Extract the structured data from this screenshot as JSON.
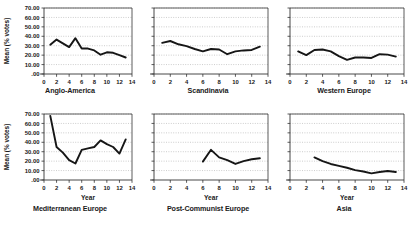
{
  "figure": {
    "background_color": "#ffffff",
    "line_color": "#161616",
    "grid_color": "#9a9a9a",
    "axis_color": "#333333",
    "text_color": "#1a1a1a"
  },
  "chart_data": [
    {
      "type": "line",
      "title": "Anglo-America",
      "xlabel": "",
      "ylabel": "Mean (% votes)",
      "xlim": [
        0,
        14
      ],
      "ylim": [
        0,
        70
      ],
      "xticks": [
        0,
        2,
        4,
        6,
        8,
        10,
        12,
        14
      ],
      "xticklabels": [
        "0",
        "2",
        "4",
        "6",
        "8",
        "10",
        "12",
        "14"
      ],
      "yticks": [
        0,
        10,
        20,
        30,
        40,
        50,
        60,
        70
      ],
      "yticklabels": [
        ".00",
        "10.00",
        "20.00",
        "30.00",
        "40.00",
        "50.00",
        "60.00",
        "70.00"
      ],
      "grid": true,
      "legend": "none",
      "x": [
        1,
        2,
        3,
        4,
        5,
        6,
        7,
        8,
        9,
        10,
        11,
        12,
        13
      ],
      "values": [
        31.0,
        36.5,
        32.5,
        28.5,
        38.0,
        27.0,
        27.0,
        25.0,
        20.5,
        23.0,
        22.5,
        20.0,
        17.5
      ]
    },
    {
      "type": "line",
      "title": "Scandinavia",
      "xlabel": "",
      "ylabel": "",
      "xlim": [
        0,
        14
      ],
      "ylim": [
        0,
        70
      ],
      "xticks": [
        0,
        2,
        4,
        6,
        8,
        10,
        12,
        14
      ],
      "xticklabels": [
        "0",
        "2",
        "4",
        "6",
        "8",
        "10",
        "12",
        "14"
      ],
      "yticks": [
        0,
        10,
        20,
        30,
        40,
        50,
        60,
        70
      ],
      "yticklabels": [
        ".00",
        "10.00",
        "20.00",
        "30.00",
        "40.00",
        "50.00",
        "60.00",
        "70.00"
      ],
      "grid": true,
      "legend": "none",
      "x": [
        1,
        2,
        3,
        4,
        5,
        6,
        7,
        8,
        9,
        10,
        11,
        12,
        13
      ],
      "values": [
        33.0,
        35.0,
        31.5,
        29.5,
        26.5,
        24.0,
        26.5,
        26.0,
        21.0,
        24.0,
        25.0,
        25.5,
        29.0
      ]
    },
    {
      "type": "line",
      "title": "Western Europe",
      "xlabel": "",
      "ylabel": "",
      "xlim": [
        0,
        14
      ],
      "ylim": [
        0,
        70
      ],
      "xticks": [
        0,
        2,
        4,
        6,
        8,
        10,
        12,
        14
      ],
      "xticklabels": [
        "0",
        "2",
        "4",
        "6",
        "8",
        "10",
        "12",
        "14"
      ],
      "yticks": [
        0,
        10,
        20,
        30,
        40,
        50,
        60,
        70
      ],
      "yticklabels": [
        ".00",
        "10.00",
        "20.00",
        "30.00",
        "40.00",
        "50.00",
        "60.00",
        "70.00"
      ],
      "grid": true,
      "legend": "none",
      "x": [
        1,
        2,
        3,
        4,
        5,
        6,
        7,
        8,
        9,
        10,
        11,
        12,
        13
      ],
      "values": [
        24.0,
        20.0,
        25.5,
        26.0,
        24.0,
        19.0,
        15.0,
        17.5,
        17.5,
        17.0,
        21.0,
        20.5,
        18.5
      ]
    },
    {
      "type": "line",
      "title": "Mediterranean Europe",
      "xlabel": "Year",
      "ylabel": "Mean (% votes)",
      "xlim": [
        0,
        14
      ],
      "ylim": [
        0,
        70
      ],
      "xticks": [
        0,
        2,
        4,
        6,
        8,
        10,
        12,
        14
      ],
      "xticklabels": [
        "0",
        "2",
        "4",
        "6",
        "8",
        "10",
        "12",
        "14"
      ],
      "yticks": [
        0,
        10,
        20,
        30,
        40,
        50,
        60,
        70
      ],
      "yticklabels": [
        ".00",
        "10.00",
        "20.00",
        "30.00",
        "40.00",
        "50.00",
        "60.00",
        "70.00"
      ],
      "grid": true,
      "legend": "none",
      "x": [
        1,
        2,
        3,
        4,
        5,
        6,
        7,
        8,
        9,
        10,
        11,
        12,
        13
      ],
      "values": [
        68.0,
        35.0,
        29.0,
        21.0,
        17.5,
        32.0,
        33.5,
        35.0,
        42.0,
        38.0,
        35.0,
        28.0,
        43.0
      ]
    },
    {
      "type": "line",
      "title": "Post-Communist Europe",
      "xlabel": "Year",
      "ylabel": "",
      "xlim": [
        0,
        14
      ],
      "ylim": [
        0,
        70
      ],
      "xticks": [
        0,
        2,
        4,
        6,
        8,
        10,
        12,
        14
      ],
      "xticklabels": [
        "0",
        "2",
        "4",
        "6",
        "8",
        "10",
        "12",
        "14"
      ],
      "yticks": [
        0,
        10,
        20,
        30,
        40,
        50,
        60,
        70
      ],
      "yticklabels": [
        ".00",
        "10.00",
        "20.00",
        "30.00",
        "40.00",
        "50.00",
        "60.00",
        "70.00"
      ],
      "grid": true,
      "legend": "none",
      "x": [
        6,
        7,
        8,
        9,
        10,
        11,
        12,
        13
      ],
      "values": [
        19.5,
        32.0,
        24.0,
        21.0,
        17.0,
        20.0,
        22.0,
        23.0
      ]
    },
    {
      "type": "line",
      "title": "Asia",
      "xlabel": "Year",
      "ylabel": "",
      "xlim": [
        0,
        14
      ],
      "ylim": [
        0,
        70
      ],
      "xticks": [
        0,
        2,
        4,
        6,
        8,
        10,
        12,
        14
      ],
      "xticklabels": [
        "0",
        "2",
        "4",
        "6",
        "8",
        "10",
        "12",
        "14"
      ],
      "yticks": [
        0,
        10,
        20,
        30,
        40,
        50,
        60,
        70
      ],
      "yticklabels": [
        ".00",
        "10.00",
        "20.00",
        "30.00",
        "40.00",
        "50.00",
        "60.00",
        "70.00"
      ],
      "grid": true,
      "legend": "none",
      "x": [
        3,
        4,
        5,
        6,
        7,
        8,
        9,
        10,
        11,
        12,
        13
      ],
      "values": [
        24.0,
        20.0,
        17.0,
        15.0,
        13.0,
        10.5,
        9.0,
        7.0,
        8.5,
        9.5,
        8.5
      ]
    }
  ]
}
